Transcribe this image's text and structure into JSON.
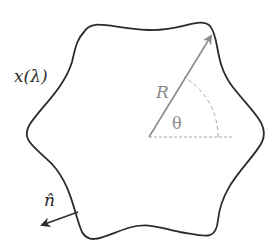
{
  "diagram": {
    "shape": "hexagonal-star-like closed curve with concave edges",
    "labels": {
      "curve": "x(λ)",
      "radius": "R",
      "angle": "θ",
      "normal": "n̂"
    },
    "colors": {
      "curve": "#2b2b2b",
      "radius_arrow": "#8c8c8c",
      "dashed": "#a6a6a6",
      "normal_arrow": "#2b2b2b"
    }
  }
}
